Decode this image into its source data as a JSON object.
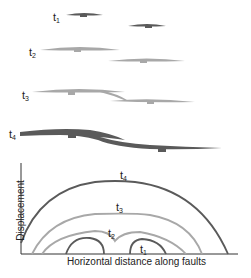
{
  "stages": [
    {
      "label": "t",
      "sub": "1"
    },
    {
      "label": "t",
      "sub": "2"
    },
    {
      "label": "t",
      "sub": "3"
    },
    {
      "label": "t",
      "sub": "4"
    }
  ],
  "graph": {
    "xlabel": "Horizontal distance along faults",
    "ylabel": "Displacement",
    "curve_labels": [
      {
        "label": "t",
        "sub": "4"
      },
      {
        "label": "t",
        "sub": "3"
      },
      {
        "label": "t",
        "sub": "2"
      },
      {
        "label": "t",
        "sub": "1"
      }
    ]
  },
  "colors": {
    "dark": "#5a5a5a",
    "light": "#a8a8a8",
    "axis": "#333333"
  }
}
